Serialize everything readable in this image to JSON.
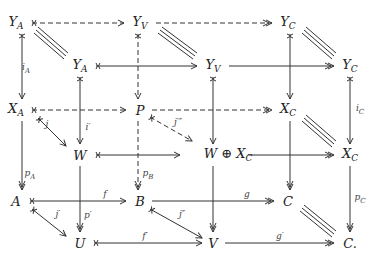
{
  "diagram": {
    "type": "commutative-diagram",
    "nodes": {
      "YA_back": {
        "base": "Y",
        "sub": "A",
        "x": 16,
        "y": 23
      },
      "YV_back": {
        "base": "Y",
        "sub": "V",
        "x": 140,
        "y": 23
      },
      "YC_back": {
        "base": "Y",
        "sub": "C",
        "x": 288,
        "y": 23
      },
      "YA_front": {
        "base": "Y",
        "sub": "A",
        "x": 80,
        "y": 66
      },
      "YV_front": {
        "base": "Y",
        "sub": "V",
        "x": 213,
        "y": 66
      },
      "YC_front": {
        "base": "Y",
        "sub": "C",
        "x": 350,
        "y": 66
      },
      "XA": {
        "base": "X",
        "sub": "A",
        "x": 16,
        "y": 110
      },
      "P": {
        "base": "P",
        "sub": "",
        "x": 140,
        "y": 110
      },
      "XC_back": {
        "base": "X",
        "sub": "C",
        "x": 288,
        "y": 110
      },
      "W": {
        "base": "W",
        "sub": "",
        "x": 80,
        "y": 155
      },
      "WplusXC": {
        "base": "W ⊕ X",
        "sub": "C",
        "x": 228,
        "y": 155
      },
      "XC_front": {
        "base": "X",
        "sub": "C",
        "x": 350,
        "y": 155
      },
      "A": {
        "base": "A",
        "sub": "",
        "x": 16,
        "y": 201
      },
      "B": {
        "base": "B",
        "sub": "",
        "x": 140,
        "y": 201
      },
      "C_back": {
        "base": "C",
        "sub": "",
        "x": 288,
        "y": 201
      },
      "U": {
        "base": "U",
        "sub": "",
        "x": 80,
        "y": 243
      },
      "V": {
        "base": "V",
        "sub": "",
        "x": 213,
        "y": 243
      },
      "C_front": {
        "base": "C.",
        "sub": "",
        "x": 350,
        "y": 243
      }
    },
    "labels": {
      "iA": {
        "base": "i",
        "sub": "A",
        "x": 26,
        "y": 69
      },
      "iC": {
        "base": "i",
        "sub": "C",
        "x": 360,
        "y": 110
      },
      "j": {
        "base": "j",
        "sub": "",
        "x": 47,
        "y": 124
      },
      "iprime": {
        "base": "i′",
        "sub": "",
        "x": 88,
        "y": 127
      },
      "jtriple": {
        "base": "j′″",
        "sub": "",
        "x": 178,
        "y": 122
      },
      "pA": {
        "base": "p",
        "sub": "A",
        "x": 30,
        "y": 175
      },
      "pB": {
        "base": "p",
        "sub": "B",
        "x": 148,
        "y": 175
      },
      "pprime": {
        "base": "p′",
        "sub": "",
        "x": 88,
        "y": 215
      },
      "f": {
        "base": "f",
        "sub": "",
        "x": 105,
        "y": 194
      },
      "g": {
        "base": "g",
        "sub": "",
        "x": 247,
        "y": 194
      },
      "jprime": {
        "base": "j′",
        "sub": "",
        "x": 58,
        "y": 214
      },
      "jdoubleprime": {
        "base": "j″",
        "sub": "",
        "x": 182,
        "y": 214
      },
      "fprime": {
        "base": "f′",
        "sub": "",
        "x": 145,
        "y": 236
      },
      "gprime": {
        "base": "g′",
        "sub": "",
        "x": 280,
        "y": 236
      },
      "pC": {
        "base": "p",
        "sub": "C",
        "x": 360,
        "y": 199
      }
    },
    "colors": {
      "ink": "#222222",
      "line": "#333333",
      "label": "#444444",
      "background": "#ffffff"
    }
  }
}
